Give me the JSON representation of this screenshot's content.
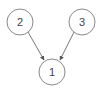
{
  "diagram": {
    "type": "directed-graph",
    "nodes": [
      {
        "id": "n1",
        "label": "1",
        "cx": 52,
        "cy": 72,
        "r": 13
      },
      {
        "id": "n2",
        "label": "2",
        "cx": 20,
        "cy": 22,
        "r": 13
      },
      {
        "id": "n3",
        "label": "3",
        "cx": 82,
        "cy": 22,
        "r": 13
      }
    ],
    "edges": [
      {
        "from": "n2",
        "to": "n1"
      },
      {
        "from": "n3",
        "to": "n1"
      }
    ],
    "colors": {
      "stroke": "#8a8a8a",
      "edge": "#6a6a6a",
      "text": "#444444",
      "background": "#ffffff"
    }
  }
}
